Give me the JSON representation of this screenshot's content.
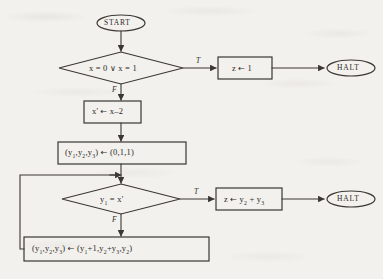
{
  "diagram": {
    "type": "flowchart",
    "title": "",
    "nodes": [
      {
        "id": "start",
        "shape": "terminator",
        "label": "START"
      },
      {
        "id": "cond1",
        "shape": "decision",
        "label": "x = 0 ∨ x = 1"
      },
      {
        "id": "setz1",
        "shape": "process",
        "label": "z ← 1"
      },
      {
        "id": "halt1",
        "shape": "terminator",
        "label": "HALT"
      },
      {
        "id": "xprime",
        "shape": "process",
        "label": "x' ← x–2"
      },
      {
        "id": "initY",
        "shape": "process",
        "label": "(y1,y2,y3) ← (0,1,1)"
      },
      {
        "id": "cond2",
        "shape": "decision",
        "label": "y1 = x'"
      },
      {
        "id": "setzsum",
        "shape": "process",
        "label": "z ← y2 + y3"
      },
      {
        "id": "halt2",
        "shape": "terminator",
        "label": "HALT"
      },
      {
        "id": "update",
        "shape": "process",
        "label": "(y1,y2,y3) ← (y1+1,y2+y3,y2)"
      }
    ],
    "edges": [
      {
        "from": "start",
        "to": "cond1",
        "label": ""
      },
      {
        "from": "cond1",
        "to": "setz1",
        "label": "T"
      },
      {
        "from": "cond1",
        "to": "xprime",
        "label": "F"
      },
      {
        "from": "setz1",
        "to": "halt1",
        "label": ""
      },
      {
        "from": "xprime",
        "to": "initY",
        "label": ""
      },
      {
        "from": "initY",
        "to": "cond2",
        "label": ""
      },
      {
        "from": "cond2",
        "to": "setzsum",
        "label": "T"
      },
      {
        "from": "cond2",
        "to": "update",
        "label": "F"
      },
      {
        "from": "setzsum",
        "to": "halt2",
        "label": ""
      },
      {
        "from": "update",
        "to": "cond2",
        "label": ""
      }
    ],
    "branch_labels": {
      "cond1_true": "T",
      "cond1_false": "F",
      "cond2_true": "T",
      "cond2_false": "F"
    },
    "text": {
      "start": "START",
      "cond1": "x = 0 ∨ x = 1",
      "setz1_var": "z",
      "setz1_arrow": "←",
      "setz1_val": "1",
      "halt1": "HALT",
      "xprime_lhs": "x'",
      "xprime_arrow": "←",
      "xprime_rhs": "x–2",
      "initY_lhs_open": "(y",
      "initY_full": "(y1,y2,y3) ← (0,1,1)",
      "cond2_full": "y1 = x'",
      "setzsum_full": "z ← y2 + y3",
      "halt2": "HALT",
      "update_full": "(y1,y2,y3) ← (y1+1,y2+y3,y2)"
    },
    "colors": {
      "ink": "#2c2a28",
      "paper": "#f3f1ed",
      "line": "#3a3734"
    }
  }
}
